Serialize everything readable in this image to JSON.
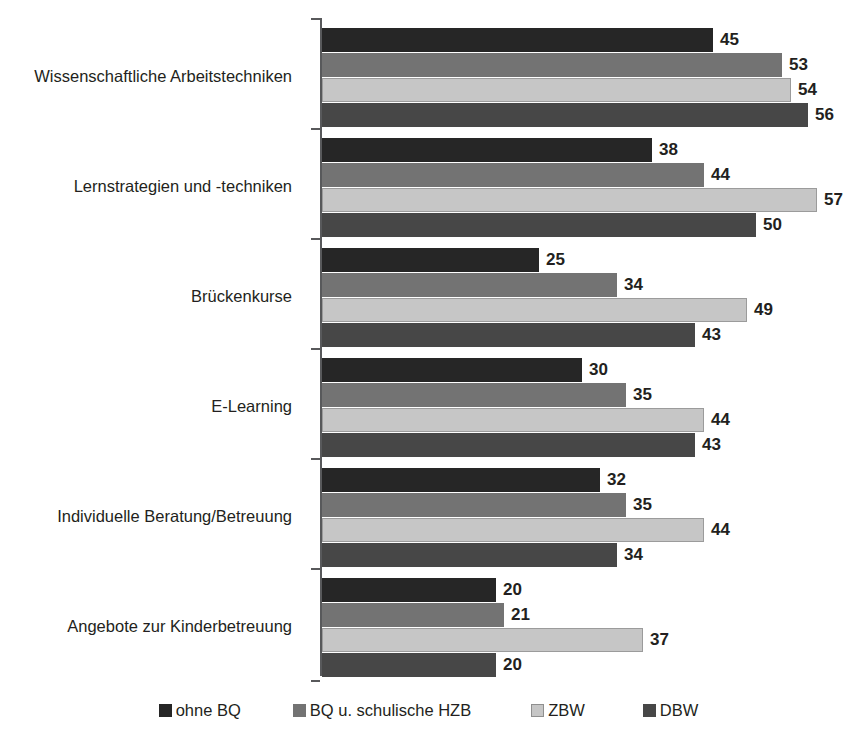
{
  "chart_data": {
    "type": "bar",
    "orientation": "horizontal",
    "title": "",
    "subtitle": "",
    "xlabel": "",
    "ylabel": "",
    "xlim": [
      0,
      60
    ],
    "grid": false,
    "legend_position": "bottom",
    "value_labels": true,
    "categories": [
      "Wissenschaftliche Arbeitstechniken",
      "Lernstrategien und -techniken",
      "Brückenkurse",
      "E-Learning",
      "Individuelle Beratung/Betreuung",
      "Angebote zur Kinderbetreuung"
    ],
    "series": [
      {
        "name": "ohne BQ",
        "color": "#262626",
        "values": [
          45,
          38,
          25,
          30,
          32,
          20
        ]
      },
      {
        "name": "BQ u. schulische HZB",
        "color": "#737373",
        "values": [
          53,
          44,
          34,
          35,
          35,
          21
        ]
      },
      {
        "name": "ZBW",
        "color": "#c6c6c6",
        "values": [
          54,
          57,
          49,
          44,
          44,
          37
        ]
      },
      {
        "name": "DBW",
        "color": "#474747",
        "values": [
          56,
          50,
          43,
          43,
          34,
          20
        ]
      }
    ]
  },
  "legend": {
    "items": [
      {
        "label": "ohne BQ",
        "swatch": "legend-swatch-ohne-bq"
      },
      {
        "label": "BQ u. schulische HZB",
        "swatch": "legend-swatch-bq-u-schulische-hzb"
      },
      {
        "label": "ZBW",
        "swatch": "legend-swatch-zbw"
      },
      {
        "label": "DBW",
        "swatch": "legend-swatch-dbw"
      }
    ]
  },
  "axis": {
    "spine_color": "#58595b",
    "tick_color": "#58595b"
  }
}
